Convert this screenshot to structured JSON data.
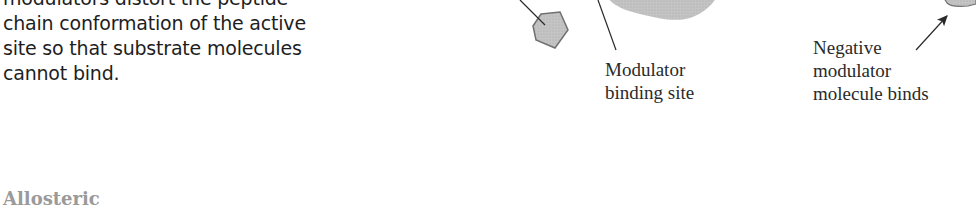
{
  "caption": {
    "lines": [
      "modulators distort the peptide",
      "chain conformation of the active",
      "site so that substrate molecules",
      "cannot bind."
    ]
  },
  "section_heading": "Allosteric",
  "diagram": {
    "labels": {
      "binding_site": [
        "Modulator",
        "binding site"
      ],
      "negative_modulator": [
        "Negative",
        "modulator",
        "molecule binds"
      ]
    },
    "colors": {
      "shape_fill": "#c8c8c8",
      "shape_stroke": "#707070",
      "line": "#2a2a2a"
    }
  }
}
